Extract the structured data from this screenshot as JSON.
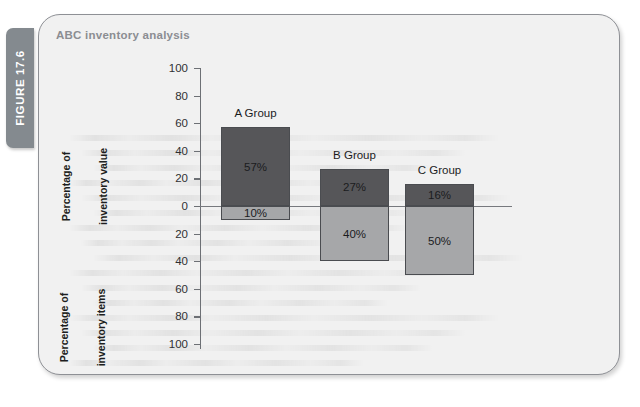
{
  "figure": {
    "tab_label": "FIGURE 17.6",
    "title": "ABC inventory analysis"
  },
  "colors": {
    "panel_bg": "#f1f1f1",
    "panel_border": "#8e9095",
    "tab_bg": "#848a8f",
    "title_text": "#8b8d92",
    "bar_value": "#565659",
    "bar_items": "#a6a7a9",
    "bar_outline": "#4a4c50",
    "axis": "#6d7075"
  },
  "chart_data": {
    "type": "bar",
    "title": "ABC inventory analysis",
    "subtype": "diverging-stacked",
    "categories": [
      "A Group",
      "B Group",
      "C Group"
    ],
    "series": [
      {
        "name": "Percentage of inventory value",
        "direction": "up",
        "values": [
          57,
          27,
          16
        ],
        "labels": [
          "57%",
          "27%",
          "16%"
        ],
        "color": "#565659"
      },
      {
        "name": "Percentage of inventory items",
        "direction": "down",
        "values": [
          10,
          40,
          50
        ],
        "labels": [
          "10%",
          "40%",
          "50%"
        ],
        "color": "#a6a7a9"
      }
    ],
    "xlabel": "",
    "ylabel_upper": "Percentage of\ninventory value",
    "ylabel_lower": "Percentage of\ninventory items",
    "ylim_upper": [
      0,
      100
    ],
    "ylim_lower": [
      0,
      100
    ],
    "yticks_upper": [
      0,
      20,
      40,
      60,
      80,
      100
    ],
    "yticks_lower": [
      20,
      40,
      60,
      80,
      100
    ],
    "ytick_labels_upper": [
      "0",
      "20",
      "40",
      "60",
      "80",
      "100"
    ],
    "ytick_labels_lower": [
      "20",
      "40",
      "60",
      "80",
      "100"
    ],
    "grid": false,
    "legend": "none",
    "zero_line": true
  },
  "axis": {
    "upper_ticks": [
      {
        "label": "100",
        "value": 100
      },
      {
        "label": "80",
        "value": 80
      },
      {
        "label": "60",
        "value": 60
      },
      {
        "label": "40",
        "value": 40
      },
      {
        "label": "20",
        "value": 20
      },
      {
        "label": "0",
        "value": 0
      }
    ],
    "lower_ticks": [
      {
        "label": "20",
        "value": 20
      },
      {
        "label": "40",
        "value": 40
      },
      {
        "label": "60",
        "value": 60
      },
      {
        "label": "80",
        "value": 80
      },
      {
        "label": "100",
        "value": 100
      }
    ],
    "caption_upper_line1": "Percentage of",
    "caption_upper_line2": "inventory value",
    "caption_lower_line1": "Percentage of",
    "caption_lower_line2": "inventory items"
  },
  "groups": [
    {
      "name": "A Group",
      "value_pct": "57%",
      "items_pct": "10%"
    },
    {
      "name": "B Group",
      "value_pct": "27%",
      "items_pct": "40%"
    },
    {
      "name": "C Group",
      "value_pct": "16%",
      "items_pct": "50%"
    }
  ]
}
